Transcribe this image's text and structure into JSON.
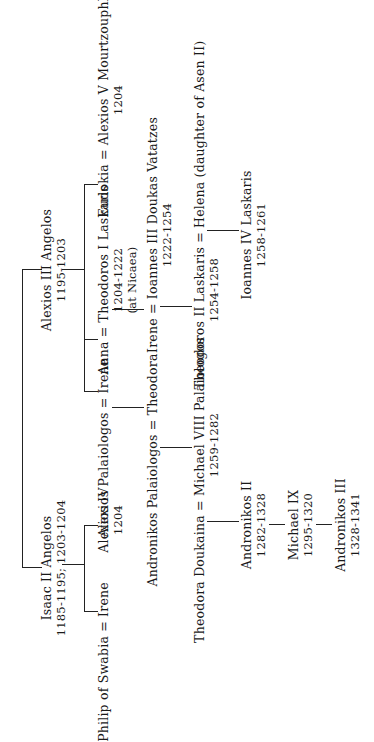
{
  "persons": {
    "isaac2": {
      "name": "Isaac II Angelos",
      "dates": "1185-1195; 1203-1204"
    },
    "alexios3": {
      "name": "Alexios III Angelos",
      "dates": "1195-1203"
    },
    "philip_irene": {
      "name": "Philip of Swabia = Irene"
    },
    "alexios4": {
      "name": "Alexios IV",
      "dates": "1204"
    },
    "alexios_pal_irene": {
      "name": "Alexios Palaiologos = Irene"
    },
    "anna_theodoros1": {
      "name": "Anna = Theodoros I Laskaris",
      "dates": "1204-1222",
      "note": "(at Nicaea)"
    },
    "eudokia_alexios5": {
      "name": "Eudokia = Alexios V Mourtzouphlos",
      "dates": "1204"
    },
    "andronikos_theodora": {
      "name": "Andronikos Palaiologos = Theodora"
    },
    "irene_ioannes3": {
      "name": "Irene = Ioannes III Doukas Vatatzes",
      "dates": "1222-1254"
    },
    "theodora_michael8": {
      "name": "Theodora Doukaina = Michael VIII Palaiologos",
      "dates": "1259-1282"
    },
    "theodoros2_helena": {
      "name": "Theodoros II Laskaris = Helena (daughter of Asen II)",
      "dates": "1254-1258"
    },
    "andronikos2": {
      "name": "Andronikos II",
      "dates": "1282-1328"
    },
    "ioannes4": {
      "name": "Ioannes IV Laskaris",
      "dates": "1258-1261"
    },
    "michael9": {
      "name": "Michael IX",
      "dates": "1295-1320"
    },
    "andronikos3": {
      "name": "Andronikos III",
      "dates": "1328-1341"
    }
  },
  "style": {
    "line_color": "#222222",
    "text_color": "#1a1a1a",
    "background": "#ffffff"
  }
}
